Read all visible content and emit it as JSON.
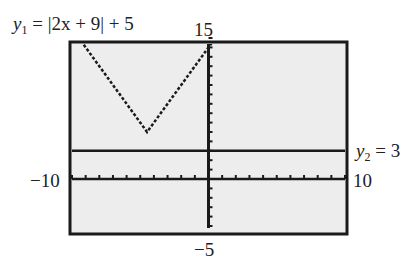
{
  "chart_data": {
    "type": "line",
    "title": "",
    "window": {
      "xmin": -10,
      "xmax": 10,
      "ymin": -5,
      "ymax": 15,
      "xscl": 1,
      "yscl": 1
    },
    "series": [
      {
        "name": "y1",
        "equation": "|2x + 9| + 5",
        "points": [
          [
            -10,
            16
          ],
          [
            -4.5,
            5
          ],
          [
            3,
            20
          ]
        ]
      },
      {
        "name": "y2",
        "equation": "3",
        "points": [
          [
            -10,
            3
          ],
          [
            10,
            3
          ]
        ]
      }
    ],
    "labels": {
      "y1": {
        "var": "y",
        "sub": "1",
        "rest": " = |2x + 9| + 5"
      },
      "y2": {
        "var": "y",
        "sub": "2",
        "rest": " = 3"
      },
      "ymax": "15",
      "ymin": "−5",
      "xmin": "−10",
      "xmax": "10"
    },
    "grid": false,
    "colors": {
      "screen": "#ededed",
      "ink": "#1a1a1a"
    }
  }
}
